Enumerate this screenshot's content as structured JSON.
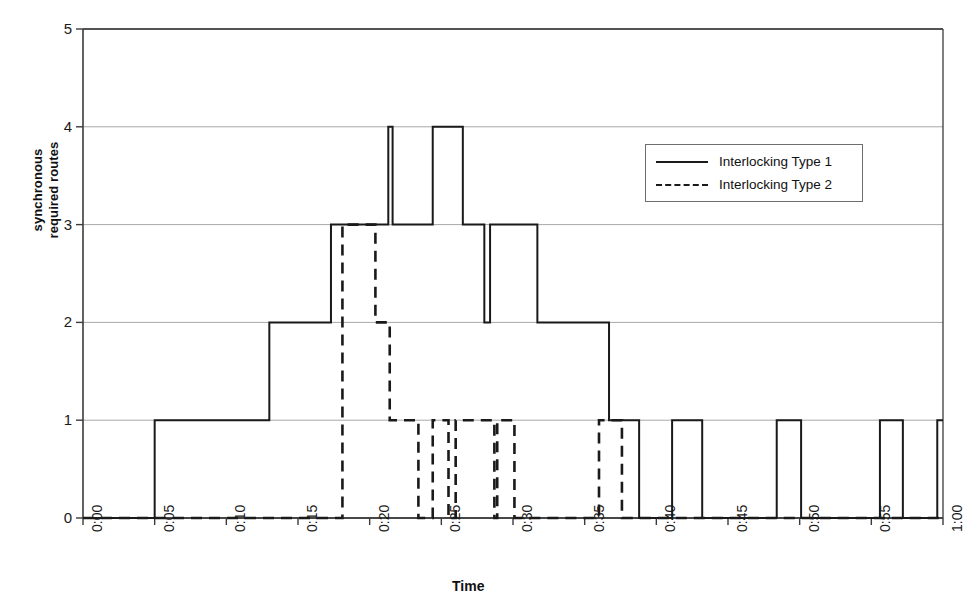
{
  "chart_title": "",
  "legend": {
    "position": "inside-top-right",
    "entries": [
      {
        "label": "Interlocking Type 1",
        "style": "solid"
      },
      {
        "label": "Interlocking Type 2",
        "style": "dashed"
      }
    ]
  },
  "axes": {
    "x": {
      "label": "Time",
      "ticks": [
        "0:00",
        "0:05",
        "0:10",
        "0:15",
        "0:20",
        "0:25",
        "0:30",
        "0:35",
        "0:40",
        "0:45",
        "0:50",
        "0:55",
        "1:00"
      ],
      "range_minutes": [
        0,
        60
      ],
      "tick_interval_minutes": 5,
      "tick_label_rotation_deg": -90
    },
    "y": {
      "label_line1": "synchronous",
      "label_line2": "required routes",
      "ticks": [
        "0",
        "1",
        "2",
        "3",
        "4",
        "5"
      ],
      "range": [
        0,
        5
      ],
      "tick_interval": 1,
      "gridlines": true
    }
  },
  "colors": {
    "series": "#1a1a1a",
    "gridline": "#a8a8a8",
    "axis": "#3b3b3b",
    "background": "#ffffff"
  },
  "chart_data": {
    "type": "line",
    "subtype": "step",
    "title": "",
    "xlabel": "Time",
    "ylabel": "synchronous required routes",
    "xlim": [
      0,
      60
    ],
    "ylim": [
      0,
      5
    ],
    "x_unit": "minutes",
    "grid": true,
    "legend_position": "inside-top-right",
    "series": [
      {
        "name": "Interlocking Type 1",
        "style": "solid",
        "steps": [
          {
            "x": 0.0,
            "y": 0
          },
          {
            "x": 5.0,
            "y": 1
          },
          {
            "x": 13.0,
            "y": 2
          },
          {
            "x": 17.3,
            "y": 3
          },
          {
            "x": 21.3,
            "y": 4
          },
          {
            "x": 21.6,
            "y": 3
          },
          {
            "x": 24.4,
            "y": 4
          },
          {
            "x": 26.5,
            "y": 3
          },
          {
            "x": 28.0,
            "y": 2
          },
          {
            "x": 28.4,
            "y": 3
          },
          {
            "x": 31.7,
            "y": 2
          },
          {
            "x": 36.7,
            "y": 1
          },
          {
            "x": 38.8,
            "y": 0
          },
          {
            "x": 41.1,
            "y": 1
          },
          {
            "x": 43.2,
            "y": 0
          },
          {
            "x": 48.4,
            "y": 1
          },
          {
            "x": 50.1,
            "y": 0
          },
          {
            "x": 55.6,
            "y": 1
          },
          {
            "x": 57.2,
            "y": 0
          },
          {
            "x": 59.6,
            "y": 1
          },
          {
            "x": 60.0,
            "y": 1
          }
        ]
      },
      {
        "name": "Interlocking Type 2",
        "style": "dashed",
        "steps": [
          {
            "x": 0.0,
            "y": 0
          },
          {
            "x": 18.1,
            "y": 3
          },
          {
            "x": 20.4,
            "y": 2
          },
          {
            "x": 21.4,
            "y": 1
          },
          {
            "x": 23.4,
            "y": 0
          },
          {
            "x": 24.4,
            "y": 1
          },
          {
            "x": 25.5,
            "y": 0
          },
          {
            "x": 26.0,
            "y": 1
          },
          {
            "x": 28.7,
            "y": 0
          },
          {
            "x": 28.9,
            "y": 1
          },
          {
            "x": 30.1,
            "y": 0
          },
          {
            "x": 36.0,
            "y": 1
          },
          {
            "x": 37.6,
            "y": 0
          },
          {
            "x": 60.0,
            "y": 0
          }
        ]
      }
    ]
  },
  "plot_geometry": {
    "left_px": 83,
    "right_px": 943,
    "top_px": 29,
    "bottom_px": 518
  }
}
